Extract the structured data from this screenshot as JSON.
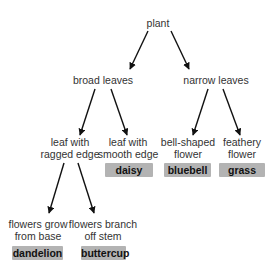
{
  "diagram": {
    "type": "dichotomous-key",
    "arrow_color": "#111111",
    "answer_box_color": "#b3b3b3",
    "nodes": {
      "root": {
        "label": "plant"
      },
      "broad": {
        "label": "broad leaves"
      },
      "narrow": {
        "label": "narrow leaves"
      },
      "ragged": {
        "line1": "leaf with",
        "line2": "ragged edge"
      },
      "smooth": {
        "line1": "leaf with",
        "line2": "smooth edge"
      },
      "bell": {
        "line1": "bell-shaped",
        "line2": "flower"
      },
      "feathery": {
        "line1": "feathery",
        "line2": "flower"
      },
      "base": {
        "line1": "flowers grow",
        "line2": "from base"
      },
      "branch": {
        "line1": "flowers branch",
        "line2": "off stem"
      }
    },
    "answers": {
      "daisy": "daisy",
      "bluebell": "bluebell",
      "grass": "grass",
      "dandelion": "dandelion",
      "buttercup": "buttercup"
    },
    "edges": [
      {
        "from": "plant",
        "to": "broad leaves"
      },
      {
        "from": "plant",
        "to": "narrow leaves"
      },
      {
        "from": "broad leaves",
        "to": "leaf with ragged edge"
      },
      {
        "from": "broad leaves",
        "to": "leaf with smooth edge"
      },
      {
        "from": "narrow leaves",
        "to": "bell-shaped flower"
      },
      {
        "from": "narrow leaves",
        "to": "feathery flower"
      },
      {
        "from": "leaf with ragged edge",
        "to": "flowers grow from base"
      },
      {
        "from": "leaf with ragged edge",
        "to": "flowers branch off stem"
      }
    ]
  }
}
